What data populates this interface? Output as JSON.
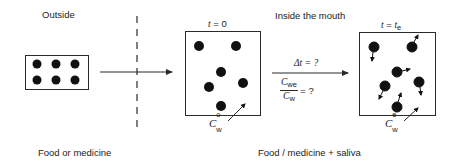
{
  "diagram": {
    "regions": {
      "outside_label": "Outside",
      "inside_label": "Inside the mouth"
    },
    "captions": {
      "left": "Food or medicine",
      "right": "Food / medicine + saliva"
    },
    "states": [
      {
        "id": "initial",
        "time_var": "t",
        "time_eq": " = 0",
        "conc_symbol": "C",
        "conc_sup": "o",
        "conc_sub": "w"
      },
      {
        "id": "equilibrium",
        "time_var": "t",
        "time_eq": " = ",
        "time_rhs": "t",
        "time_rhs_sub": "e",
        "conc_symbol": "C",
        "conc_sup": "e",
        "conc_sub": "w"
      }
    ],
    "transition": {
      "delta_t": "Δt = ?",
      "ratio_num": "C",
      "ratio_num_sub": "we",
      "ratio_den": "C",
      "ratio_den_sub": "w",
      "ratio_eq": "= ?"
    },
    "particles": {
      "source_count": 6,
      "initial_count": 6,
      "equilibrium_count": 6
    },
    "colors": {
      "line": "#2a2a2a",
      "particle": "#111111",
      "background": "#ffffff"
    }
  }
}
